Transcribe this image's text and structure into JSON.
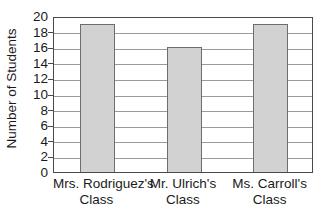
{
  "chart_data": {
    "type": "bar",
    "title": "",
    "xlabel": "",
    "ylabel": "Number of Students",
    "categories": [
      "Mrs. Rodriguez's Class",
      "Mr. Ulrich's Class",
      "Ms. Carroll's Class"
    ],
    "category_lines": [
      {
        "line1": "Mrs. Rodriguez's",
        "line2": "Class"
      },
      {
        "line1": "Mr. Ulrich's",
        "line2": "Class"
      },
      {
        "line1": "Ms. Carroll's",
        "line2": "Class"
      }
    ],
    "values": [
      19,
      16,
      19
    ],
    "ylim": [
      0,
      20
    ],
    "ytick_labels": [
      "20",
      "18",
      "16",
      "14",
      "12",
      "10",
      "8",
      "6",
      "4",
      "2",
      "0"
    ],
    "ytick_values": [
      20,
      18,
      16,
      14,
      12,
      10,
      8,
      6,
      4,
      2,
      0
    ],
    "ytick_step": 2,
    "grid": true,
    "legend": "none",
    "bar_fill_color": "#d2d2d2",
    "bar_border_color": "#6d6d6d",
    "gridline_color": "#9a9a9a",
    "axis_color": "#4a4a4a",
    "background_color": "#ffffff"
  }
}
